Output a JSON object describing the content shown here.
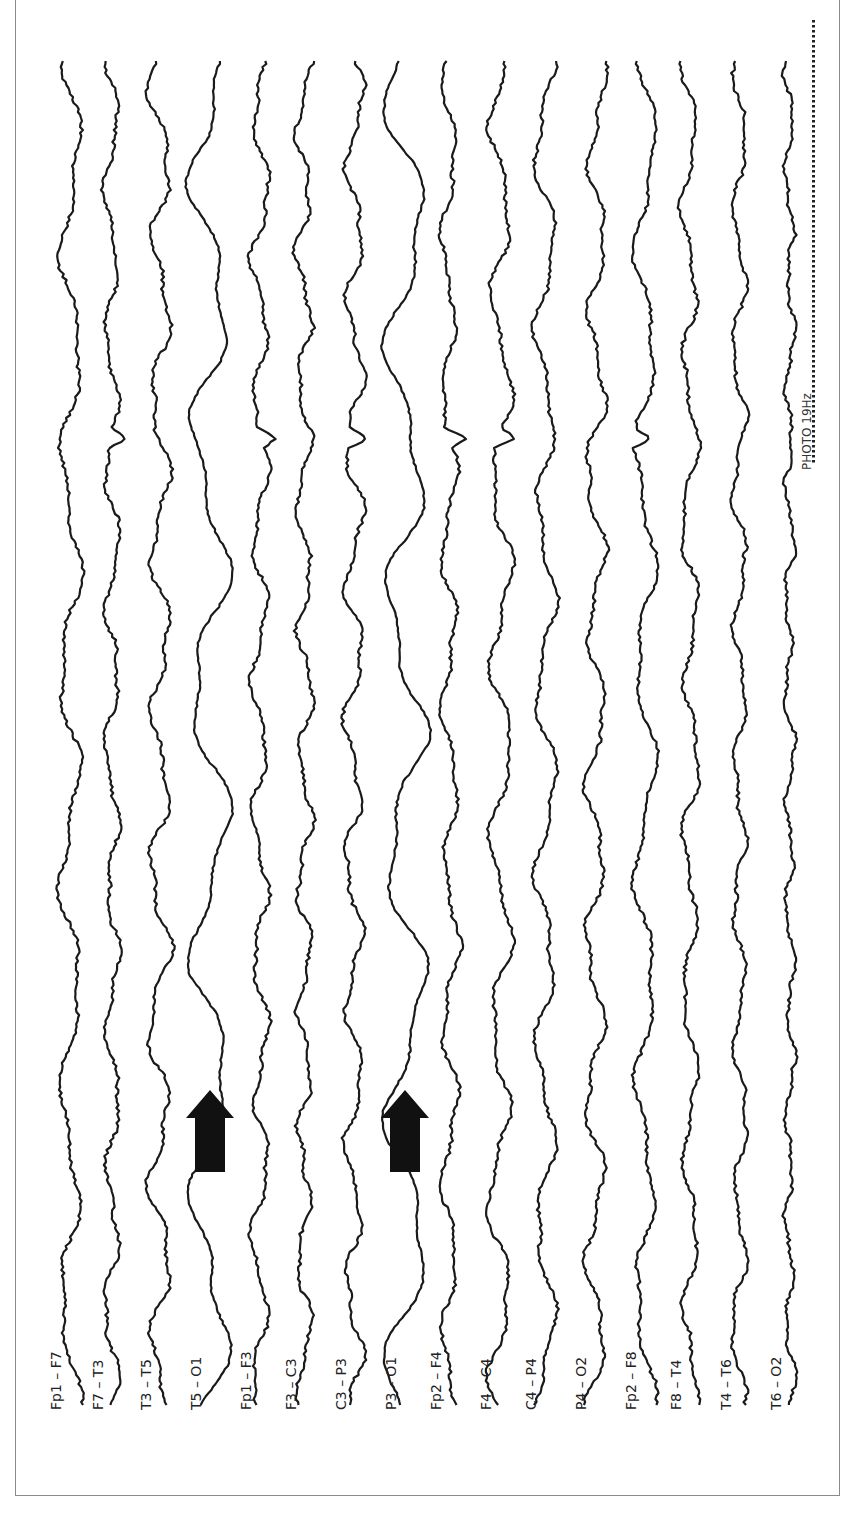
{
  "figure": {
    "type": "EEG bipolar montage tracing (rotated 90°)",
    "stimulus_annotation": "PHOTO 19Hz",
    "arrows": 2,
    "arrow_color": "#111111",
    "trace_color": "#1a1a1a",
    "frame_color": "#8a8a8a"
  },
  "channels": [
    {
      "label": "Fp1 – F7",
      "x": 70,
      "amp": 9,
      "freq": 0.03,
      "noise": 3,
      "seed": 1
    },
    {
      "label": "F7 – T3",
      "x": 112,
      "amp": 6,
      "freq": 0.045,
      "noise": 3,
      "seed": 2
    },
    {
      "label": "T3 – T5",
      "x": 160,
      "amp": 9,
      "freq": 0.04,
      "noise": 3,
      "seed": 3
    },
    {
      "label": "T5 – O1",
      "x": 210,
      "amp": 17,
      "freq": 0.0245,
      "noise": 1.5,
      "seed": 4
    },
    {
      "label": "Fp1 – F3",
      "x": 260,
      "amp": 7,
      "freq": 0.045,
      "noise": 3,
      "seed": 5
    },
    {
      "label": "F3 – C3",
      "x": 305,
      "amp": 7,
      "freq": 0.05,
      "noise": 3,
      "seed": 6
    },
    {
      "label": "C3 – P3",
      "x": 355,
      "amp": 8,
      "freq": 0.045,
      "noise": 3,
      "seed": 7
    },
    {
      "label": "P3 – O1",
      "x": 405,
      "amp": 17,
      "freq": 0.0245,
      "noise": 1.5,
      "seed": 8
    },
    {
      "label": "Fp2 – F4",
      "x": 450,
      "amp": 7,
      "freq": 0.04,
      "noise": 3,
      "seed": 9
    },
    {
      "label": "F4 – C4",
      "x": 500,
      "amp": 9,
      "freq": 0.035,
      "noise": 3,
      "seed": 10
    },
    {
      "label": "C4 – P4",
      "x": 545,
      "amp": 9,
      "freq": 0.035,
      "noise": 3,
      "seed": 11
    },
    {
      "label": "P4 – O2",
      "x": 595,
      "amp": 8,
      "freq": 0.04,
      "noise": 3,
      "seed": 12
    },
    {
      "label": "Fp2 – F8",
      "x": 645,
      "amp": 9,
      "freq": 0.03,
      "noise": 3,
      "seed": 13
    },
    {
      "label": "F8 – T4",
      "x": 690,
      "amp": 7,
      "freq": 0.04,
      "noise": 3,
      "seed": 14
    },
    {
      "label": "T4 – T6",
      "x": 740,
      "amp": 6,
      "freq": 0.045,
      "noise": 3,
      "seed": 15
    },
    {
      "label": "T6 – O2",
      "x": 790,
      "amp": 4,
      "freq": 0.06,
      "noise": 3,
      "seed": 16
    }
  ],
  "arrow_positions": [
    {
      "x": 210,
      "y": 1150
    },
    {
      "x": 405,
      "y": 1150
    }
  ],
  "spikes_y": 438,
  "photic": {
    "x": 812,
    "y_start": 20,
    "y_end": 460,
    "label_x": 800,
    "label_y": 470
  }
}
